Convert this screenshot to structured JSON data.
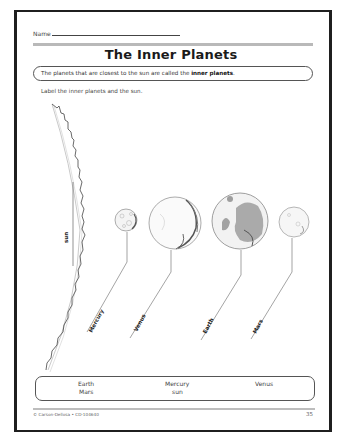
{
  "header": {
    "name_label": "Name"
  },
  "title": "The Inner Planets",
  "intro": {
    "text_before": "The planets that are closest to the sun are called the ",
    "bold_term": "inner planets",
    "text_after": "."
  },
  "instruction": "Label the inner planets and the sun.",
  "diagram": {
    "labels": [
      {
        "id": "sun",
        "text": "sun"
      },
      {
        "id": "mercury",
        "text": "Mercury"
      },
      {
        "id": "venus",
        "text": "Venus"
      },
      {
        "id": "earth",
        "text": "Earth"
      },
      {
        "id": "mars",
        "text": "Mars"
      }
    ]
  },
  "word_bank": {
    "words": [
      "Earth",
      "Mars",
      "Mercury",
      "sun",
      "Venus"
    ]
  },
  "footer": {
    "copyright": "© Carson-Dellosa • CD-104640",
    "page_number": "35"
  }
}
